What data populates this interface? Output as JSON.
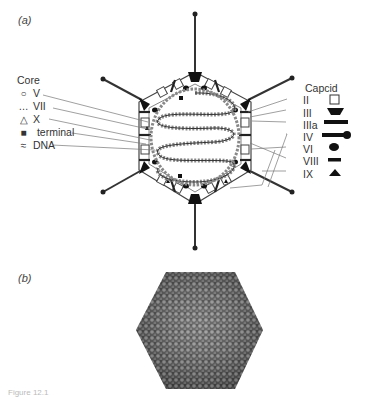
{
  "panels": {
    "a_label": "(a)",
    "b_label": "(b)"
  },
  "core_legend": {
    "title": "Core",
    "items": [
      {
        "symbol": "○",
        "label": "V"
      },
      {
        "symbol": "…",
        "label": "VII"
      },
      {
        "symbol": "△",
        "label": "X"
      },
      {
        "symbol": "■",
        "label": "terminal"
      },
      {
        "symbol": "≈",
        "label": "DNA"
      }
    ]
  },
  "capsid_legend": {
    "title": "Capcid",
    "items": [
      {
        "label": "II",
        "symbol": "open-square"
      },
      {
        "label": "III",
        "symbol": "trapezoid"
      },
      {
        "label": "IIIa",
        "symbol": "bar"
      },
      {
        "label": "IV",
        "symbol": "fiber-with-knob"
      },
      {
        "label": "VI",
        "symbol": "ellipse"
      },
      {
        "label": "VIII",
        "symbol": "short-bar"
      },
      {
        "label": "IX",
        "symbol": "triangle"
      }
    ]
  },
  "caption": "Figure 12.1"
}
